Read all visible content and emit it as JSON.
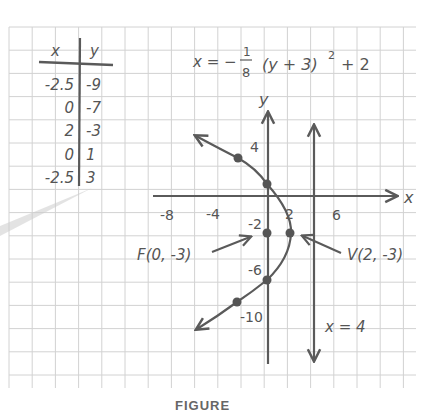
{
  "equation": {
    "lhs": "x = −",
    "frac_num": "1",
    "frac_den": "8",
    "rest": "(y + 3)",
    "exponent": "2",
    "tail": "+ 2"
  },
  "table": {
    "headers": [
      "x",
      "y"
    ],
    "rows": [
      {
        "x": "-2.5",
        "y": "-9"
      },
      {
        "x": "0",
        "y": "-7"
      },
      {
        "x": "2",
        "y": "-3"
      },
      {
        "x": "0",
        "y": "1"
      },
      {
        "x": "-2.5",
        "y": "3"
      }
    ]
  },
  "axes": {
    "x_label": "x",
    "y_label": "y",
    "x_ticks": [
      "-8",
      "-4",
      "2",
      "6"
    ],
    "y_ticks": [
      "4",
      "-2",
      "-6",
      "-10"
    ]
  },
  "annotations": {
    "focus": "F(0, -3)",
    "vertex": "V(2, -3)",
    "directrix": "x = 4"
  },
  "caption": "FIGURE",
  "colors": {
    "ink": "#5a5a5a",
    "grid": "#cfcfcf",
    "point": "#555555"
  },
  "chart_data": {
    "type": "line",
    "xlabel": "x",
    "ylabel": "y",
    "xlim": [
      -10,
      12
    ],
    "ylim": [
      -14,
      8
    ],
    "grid": true,
    "series": [
      {
        "name": "parabola",
        "points": [
          [
            -2.5,
            -9
          ],
          [
            0,
            -7
          ],
          [
            2,
            -3
          ],
          [
            0,
            1
          ],
          [
            -2.5,
            3
          ]
        ]
      }
    ],
    "focus": [
      0,
      -3
    ],
    "vertex": [
      2,
      -3
    ],
    "directrix": "x = 4",
    "x_tick_labels": [
      "-8",
      "-4",
      "2",
      "6"
    ],
    "y_tick_labels": [
      "4",
      "-2",
      "-6",
      "-10"
    ]
  }
}
